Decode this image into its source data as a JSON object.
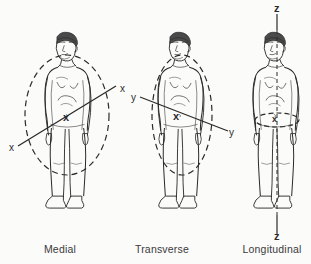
{
  "figure": {
    "title": "",
    "background_color": "#fbfbfa",
    "ink_color": "#2b2b2b",
    "panels": [
      {
        "id": "medial",
        "caption": "Medial",
        "caption_x": 60,
        "caption_y": 243,
        "plane": "sagittal-ellipse-vertical",
        "axis_letter": "x",
        "axis_type": "diagonal",
        "labels": [
          {
            "text": "x",
            "x": 9,
            "y": 142,
            "bold": false,
            "name": "axis-label-x-lower-left"
          },
          {
            "text": "x",
            "x": 120,
            "y": 83,
            "bold": false,
            "name": "axis-label-x-upper-right"
          },
          {
            "text": "x",
            "x": 63,
            "y": 111,
            "bold": true,
            "name": "axis-origin-marker-x"
          }
        ]
      },
      {
        "id": "transverse",
        "caption": "Transverse",
        "caption_x": 162,
        "caption_y": 243,
        "plane": "frontal-ellipse-vertical",
        "axis_letter": "y",
        "axis_type": "diagonal",
        "labels": [
          {
            "text": "y",
            "x": 131,
            "y": 92,
            "bold": false,
            "name": "axis-label-y-upper-left"
          },
          {
            "text": "y",
            "x": 229,
            "y": 127,
            "bold": false,
            "name": "axis-label-y-lower-right"
          },
          {
            "text": "x",
            "x": 173,
            "y": 110,
            "bold": true,
            "name": "axis-origin-marker-x"
          }
        ]
      },
      {
        "id": "longitudinal",
        "caption": "Longitudinal",
        "caption_x": 272,
        "caption_y": 243,
        "plane": "transverse-ellipse-horizontal",
        "axis_letter": "z",
        "axis_type": "vertical",
        "labels": [
          {
            "text": "z",
            "x": 274,
            "y": 4,
            "bold": true,
            "name": "axis-label-z-top"
          },
          {
            "text": "z",
            "x": 274,
            "y": 232,
            "bold": true,
            "name": "axis-label-z-bottom"
          },
          {
            "text": "x",
            "x": 268,
            "y": 117,
            "bold": true,
            "name": "axis-origin-marker-x"
          }
        ]
      }
    ]
  }
}
